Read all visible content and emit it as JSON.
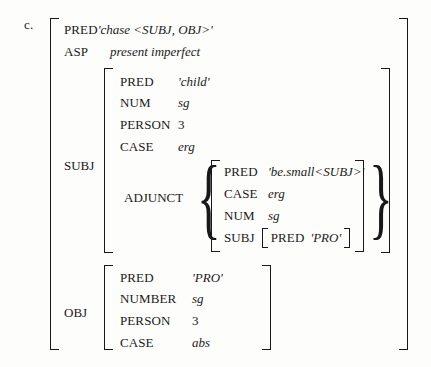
{
  "example": {
    "label": "c."
  },
  "outer": {
    "rows": [
      {
        "attr": "PRED",
        "value": "'chase <SUBJ, OBJ>'",
        "italic": true
      },
      {
        "attr": "ASP",
        "value": "present imperfect",
        "italic": true
      }
    ],
    "subj_label": "SUBJ",
    "obj_label": "OBJ"
  },
  "subj": {
    "rows": [
      {
        "attr": "PRED",
        "value": "'child'",
        "italic": true
      },
      {
        "attr": "NUM",
        "value": "sg",
        "italic": true
      },
      {
        "attr": "PERSON",
        "value": "3",
        "italic": false
      },
      {
        "attr": "CASE",
        "value": "erg",
        "italic": true
      }
    ],
    "adjunct_label": "ADJUNCT"
  },
  "adjunct": {
    "rows": [
      {
        "attr": "PRED",
        "value": "'be.small<SUBJ>'",
        "italic": true
      },
      {
        "attr": "CASE",
        "value": "erg",
        "italic": true
      },
      {
        "attr": "NUM",
        "value": "sg",
        "italic": true
      }
    ],
    "subj_label": "SUBJ",
    "subj_inner": {
      "attr": "PRED",
      "value": "'PRO'",
      "italic": true
    }
  },
  "obj": {
    "rows": [
      {
        "attr": "PRED",
        "value": "'PRO'",
        "italic": true
      },
      {
        "attr": "NUMBER",
        "value": "sg",
        "italic": true
      },
      {
        "attr": "PERSON",
        "value": "3",
        "italic": false
      },
      {
        "attr": "CASE",
        "value": "abs",
        "italic": true
      }
    ]
  },
  "braces": {
    "open": "{",
    "close": "}"
  },
  "colors": {
    "ink": "#16181a",
    "background": "#fdfdfb"
  }
}
